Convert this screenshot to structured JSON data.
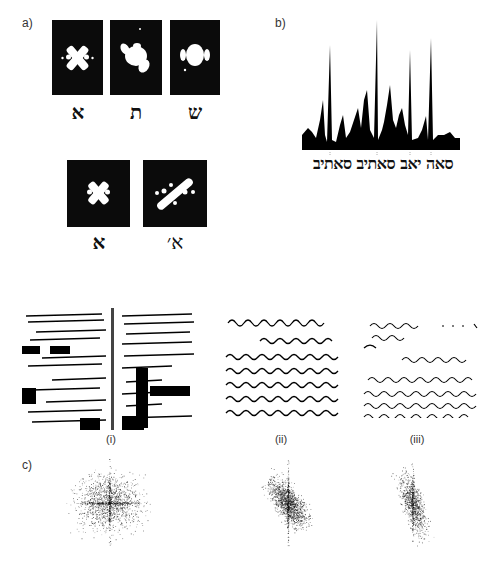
{
  "panel_a": {
    "label": "a)",
    "row1": [
      {
        "letter": "א",
        "spectrum": "x-cross-pattern"
      },
      {
        "letter": "ת",
        "spectrum": "blob-pattern"
      },
      {
        "letter": "ש",
        "spectrum": "round-blob-pattern"
      }
    ],
    "row2": [
      {
        "letter": "א",
        "spectrum": "x-cross-pattern"
      },
      {
        "letter": "א׳",
        "spectrum": "diagonal-dotted-pattern"
      }
    ]
  },
  "panel_b": {
    "label": "b)",
    "text": "סאה יאב סאתיב סאתיב",
    "description": "correlation output peaks plotted above Hebrew text string",
    "peaks_relative_height": [
      0.25,
      0.45,
      0.85,
      0.3,
      0.35,
      0.5,
      1.0,
      0.25,
      0.55,
      0.35,
      0.8,
      0.25,
      0.82,
      0.15
    ]
  },
  "panel_docs": {
    "items": [
      {
        "label": "(i)",
        "description": "two-page handwritten manuscript with redacted blocks"
      },
      {
        "label": "(ii)",
        "heading": "Monsieur le Président de l'Etat",
        "description": "handwritten letter sample"
      },
      {
        "label": "(iii)",
        "heading": "Le Cte de Wachy ... de la Guerre",
        "description": "handwritten letter sample"
      }
    ]
  },
  "panel_c": {
    "label": "c)",
    "items": [
      {
        "label": "(i)",
        "description": "Fourier spectrum with horizontal and vertical axis emphasis"
      },
      {
        "label": "(ii)",
        "description": "Fourier spectrum with diagonal emphasis"
      },
      {
        "label": "(iii)",
        "description": "Fourier spectrum with vertical/slight diagonal emphasis"
      }
    ]
  }
}
